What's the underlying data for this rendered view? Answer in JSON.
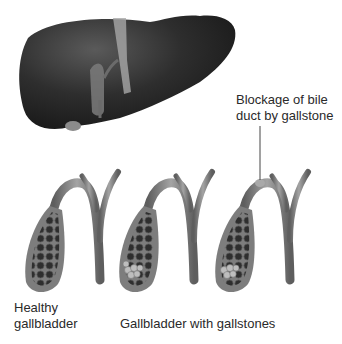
{
  "figure": {
    "organs": {
      "liver": "liver-illustration",
      "bile_ducts": "bile-duct-illustration"
    },
    "labels": {
      "blockage": "Blockage of bile duct by gallstone",
      "healthy": "Healthy gallbladder",
      "gallstones": "Gallbladder with gallstones"
    },
    "panels": [
      {
        "id": "healthy",
        "gallstones": false,
        "blockage": false
      },
      {
        "id": "with-gallstones",
        "gallstones": true,
        "blockage": false
      },
      {
        "id": "blocked-duct",
        "gallstones": true,
        "blockage": true
      }
    ],
    "colors": {
      "liver": "#2b2b2b",
      "duct": "#8a8a8a",
      "gallbladder_wall": "#7a7a7a",
      "gallbladder_inner": "#3c3c3c",
      "stone": "#b8b8b8",
      "text": "#2a2a2a"
    }
  }
}
